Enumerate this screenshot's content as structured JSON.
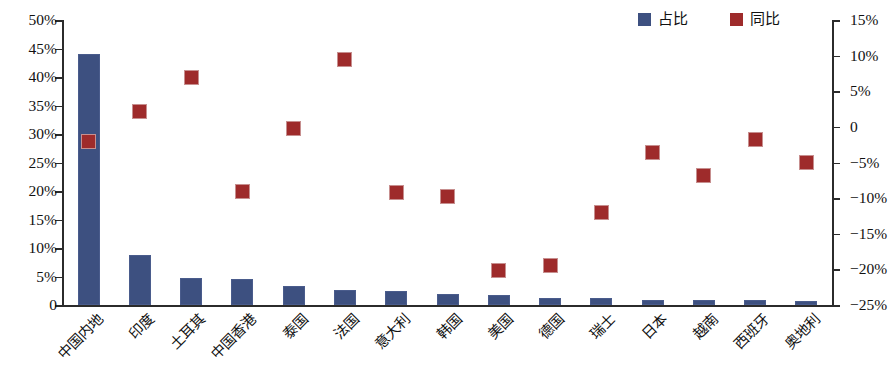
{
  "legend": {
    "items": [
      {
        "label": "占比",
        "color": "#3d5080",
        "name": "share"
      },
      {
        "label": "同比",
        "color": "#9e2b2b",
        "name": "yoy"
      }
    ]
  },
  "axes": {
    "left": {
      "ticks": [
        "50%",
        "45%",
        "40%",
        "35%",
        "30%",
        "25%",
        "20%",
        "15%",
        "10%",
        "5%",
        "0"
      ],
      "min": 0,
      "max": 50
    },
    "right": {
      "ticks": [
        "15%",
        "10%",
        "5%",
        "0",
        "−5%",
        "−10%",
        "−15%",
        "−20%",
        "−25%"
      ],
      "min": -25,
      "max": 15
    }
  },
  "chart_data": {
    "type": "bar",
    "title": "",
    "xlabel": "",
    "ylabel": "",
    "ylim": [
      0,
      50
    ],
    "y2lim": [
      -25,
      15
    ],
    "grid": false,
    "legend_position": "top-right",
    "categories": [
      "中国内地",
      "印度",
      "土耳其",
      "中国香港",
      "泰国",
      "法国",
      "意大利",
      "韩国",
      "美国",
      "德国",
      "瑞士",
      "日本",
      "越南",
      "西班牙",
      "奥地利"
    ],
    "series": [
      {
        "name": "占比",
        "type": "bar",
        "axis": "left",
        "unit": "%",
        "color": "#3d5080",
        "values": [
          44.0,
          8.8,
          4.8,
          4.5,
          3.3,
          2.7,
          2.5,
          1.9,
          1.8,
          1.3,
          1.2,
          0.9,
          0.8,
          0.8,
          0.7
        ]
      },
      {
        "name": "同比",
        "type": "scatter",
        "axis": "right",
        "unit": "%",
        "color": "#9e2b2b",
        "values": [
          -2.1,
          2.2,
          7.0,
          -9.0,
          -0.2,
          9.4,
          -9.2,
          -9.8,
          -20.2,
          -19.4,
          -12.0,
          -3.6,
          -6.8,
          -1.8,
          -5.0
        ],
        "left_axis_equivalent": [
          28.6,
          34.0,
          40.0,
          20.0,
          31.0,
          43.0,
          19.8,
          19.0,
          6.0,
          7.0,
          16.3,
          26.8,
          22.8,
          29.0,
          25.0
        ]
      }
    ]
  }
}
